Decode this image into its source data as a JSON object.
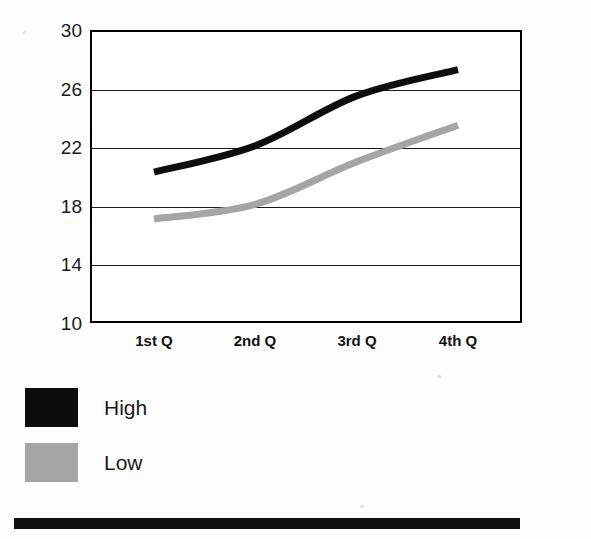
{
  "chart_data": {
    "type": "line",
    "title": "",
    "subtitle": "",
    "xlabel": "",
    "ylabel": "",
    "categories": [
      "1st Q",
      "2nd Q",
      "3rd Q",
      "4th Q"
    ],
    "ylim": [
      10,
      30
    ],
    "yticks": [
      30,
      26,
      22,
      18,
      14,
      10
    ],
    "grid": "horizontal",
    "legend_position": "below-left",
    "series": [
      {
        "name": "High",
        "color": "#0d0d0d",
        "values": [
          20.3,
          22.1,
          25.5,
          27.3
        ]
      },
      {
        "name": "Low",
        "color": "#a5a5a5",
        "values": [
          17.1,
          18.1,
          21.0,
          23.5
        ]
      }
    ],
    "annotations": []
  },
  "axes": {
    "y_tick_labels": [
      "30",
      "26",
      "22",
      "18",
      "14",
      "10"
    ],
    "x_tick_labels": [
      "1st Q",
      "2nd Q",
      "3rd Q",
      "4th Q"
    ]
  },
  "legend": {
    "items": [
      {
        "label": "High",
        "swatch_color": "#0d0d0d",
        "swatch_class": "high"
      },
      {
        "label": "Low",
        "swatch_color": "#a5a5a5",
        "swatch_class": "low"
      }
    ]
  },
  "decor": {
    "bottom_rule_color": "#101010"
  }
}
